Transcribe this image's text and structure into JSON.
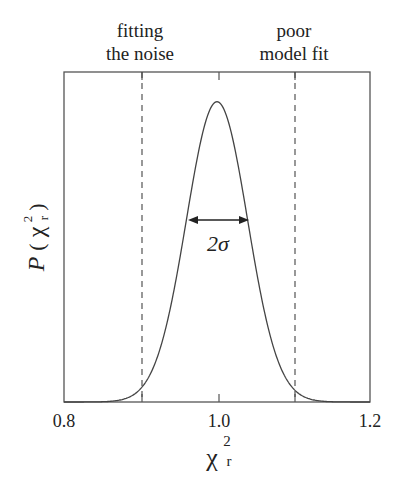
{
  "chart_data": {
    "type": "line",
    "title": "",
    "xlabel": "χ²_r",
    "ylabel": "P(χ²_r)",
    "xlim": [
      0.8,
      1.2
    ],
    "ylim": [
      0,
      1
    ],
    "xticks": [
      0.8,
      0.9,
      1.0,
      1.1,
      1.2
    ],
    "xtick_labels": [
      "0.8",
      "",
      "1.0",
      "",
      "1.2"
    ],
    "yticks": [],
    "grid": false,
    "legend": null,
    "series": [
      {
        "name": "P(chi2_r)",
        "shape": "gaussian",
        "mean": 1.0,
        "sigma": 0.04,
        "peak": 0.91,
        "x": [
          0.8,
          0.85,
          0.88,
          0.9,
          0.92,
          0.94,
          0.96,
          0.98,
          1.0,
          1.02,
          1.04,
          1.06,
          1.08,
          1.1,
          1.12,
          1.15,
          1.2
        ],
        "y": [
          0.0,
          0.004,
          0.011,
          0.04,
          0.12,
          0.3,
          0.55,
          0.8,
          0.91,
          0.8,
          0.55,
          0.3,
          0.12,
          0.04,
          0.011,
          0.004,
          0.0
        ]
      }
    ],
    "reference_lines": [
      {
        "x": 0.9,
        "style": "dashed",
        "label": "fitting the noise"
      },
      {
        "x": 1.1,
        "style": "dashed",
        "label": "poor model fit"
      }
    ],
    "annotations": [
      {
        "text": "2σ",
        "type": "double-arrow",
        "x_from": 0.96,
        "x_to": 1.04
      }
    ]
  },
  "labels": {
    "left_region_line1": "fitting",
    "left_region_line2": "the noise",
    "right_region_line1": "poor",
    "right_region_line2": "model fit",
    "width_annotation": "2σ",
    "x_tick_0": "0.8",
    "x_tick_2": "1.0",
    "x_tick_4": "1.2",
    "x_axis_symbol": "χ",
    "x_axis_sup": "2",
    "x_axis_sub": "r",
    "y_axis_P": "P",
    "y_axis_open": "(",
    "y_axis_symbol": "χ",
    "y_axis_sup": "2",
    "y_axis_sub": "r",
    "y_axis_close": ")"
  },
  "colors": {
    "line": "#444444",
    "text": "#222222",
    "background": "#ffffff"
  }
}
